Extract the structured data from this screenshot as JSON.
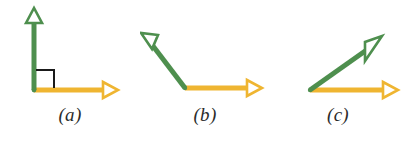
{
  "figure": {
    "background_color": "#ffffff",
    "width": 406,
    "height": 145,
    "ray_colors": {
      "initial_side": "#efb531",
      "terminal_side": "#4e8f4e",
      "right_angle_mark": "#1a1a1a"
    },
    "arrowhead_style": "hollow-outlined-triangle"
  },
  "panels": [
    {
      "id": "a",
      "label": "(a)",
      "angle_type": "right",
      "angle_degrees": 90,
      "has_right_angle_mark": true,
      "vertex": {
        "x": 34,
        "y": 90
      },
      "rays": [
        {
          "name": "terminal-side",
          "color": "#4e8f4e",
          "tip": {
            "x": 34,
            "y": 12
          },
          "direction_degrees": 90
        },
        {
          "name": "initial-side",
          "color": "#efb531",
          "tip": {
            "x": 115,
            "y": 90
          },
          "direction_degrees": 0
        }
      ]
    },
    {
      "id": "b",
      "label": "(b)",
      "angle_type": "obtuse",
      "angle_degrees": 129,
      "has_right_angle_mark": false,
      "vertex": {
        "x": 45,
        "y": 88
      },
      "rays": [
        {
          "name": "terminal-side",
          "color": "#4e8f4e",
          "tip": {
            "x": 2,
            "y": 30
          },
          "direction_degrees": 129
        },
        {
          "name": "initial-side",
          "color": "#efb531",
          "tip": {
            "x": 120,
            "y": 88
          },
          "direction_degrees": 0
        }
      ]
    },
    {
      "id": "c",
      "label": "(c)",
      "angle_type": "acute",
      "angle_degrees": 36,
      "has_right_angle_mark": false,
      "vertex": {
        "x": 40,
        "y": 90
      },
      "rays": [
        {
          "name": "terminal-side",
          "color": "#4e8f4e",
          "tip": {
            "x": 110,
            "y": 40
          },
          "direction_degrees": 36
        },
        {
          "name": "initial-side",
          "color": "#efb531",
          "tip": {
            "x": 127,
            "y": 90
          },
          "direction_degrees": 0
        }
      ]
    }
  ]
}
